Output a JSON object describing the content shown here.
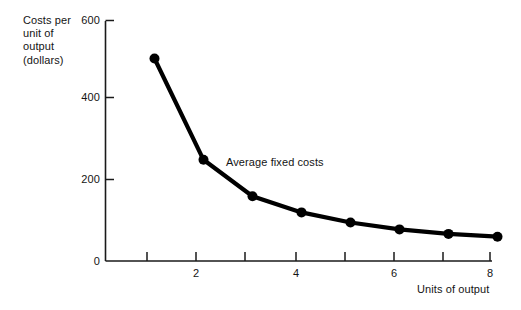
{
  "chart_data": {
    "type": "line",
    "title": "",
    "subtitle": "",
    "xlabel": "Units of output",
    "ylabel": "Costs per unit of output (dollars)",
    "ylabel_lines": [
      "Costs per",
      "unit of",
      "output",
      "(dollars)"
    ],
    "x": [
      1,
      2,
      3,
      4,
      5,
      6,
      7,
      8
    ],
    "values": [
      500,
      250,
      160,
      120,
      95,
      78,
      67,
      60
    ],
    "series": [
      {
        "name": "Average fixed costs",
        "values": [
          500,
          250,
          160,
          120,
          95,
          78,
          67,
          60
        ],
        "color": "#000000",
        "marker": "filled-circle",
        "line_width_px": 4
      }
    ],
    "annotations": [
      {
        "text": "Average fixed costs",
        "x": 3.5,
        "y": 205
      }
    ],
    "xlim": [
      0,
      8.6
    ],
    "ylim": [
      0,
      620
    ],
    "xticks": [
      1,
      2,
      3,
      4,
      5,
      6,
      7,
      8
    ],
    "xtick_labels": [
      "",
      "2",
      "",
      "4",
      "",
      "6",
      "",
      "8"
    ],
    "yticks": [
      0,
      200,
      400,
      600
    ],
    "ytick_labels": [
      "0",
      "200",
      "400",
      "600"
    ],
    "grid": false,
    "legend": "none",
    "axis_color": "#1a1a1a"
  },
  "colors": {
    "background": "#ffffff",
    "ink": "#121212",
    "curve": "#000000",
    "axis": "#1a1a1a"
  }
}
